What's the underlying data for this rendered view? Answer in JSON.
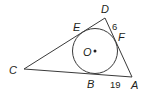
{
  "diagram": {
    "type": "triangle-with-inscribed-circle",
    "colors": {
      "stroke": "#3a3a3a",
      "text": "#231f20",
      "background": "#ffffff"
    },
    "vertices": {
      "C": {
        "label": "C",
        "x": 24,
        "y": 69
      },
      "D": {
        "label": "D",
        "x": 105,
        "y": 18
      },
      "A": {
        "label": "A",
        "x": 132,
        "y": 77
      }
    },
    "circle": {
      "center_label": "O",
      "cx": 95,
      "cy": 51,
      "r": 22.5
    },
    "tangent_points": {
      "E": {
        "label": "E"
      },
      "F": {
        "label": "F"
      },
      "B": {
        "label": "B"
      }
    },
    "measurements": {
      "DF": "6",
      "BA": "19"
    }
  }
}
